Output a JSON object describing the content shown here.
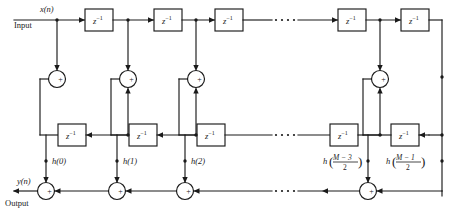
{
  "diagram": {
    "signals": {
      "input_signal": "x(n)",
      "input_label": "Input",
      "output_signal": "y(n)",
      "output_label": "Output"
    },
    "delay_label": "z",
    "delay_exponent": "−1",
    "adder_symbol": "+",
    "ellipsis": "⋯",
    "top_delays": [
      {
        "id": "top-delay-1",
        "label": "z",
        "exp": "−1"
      },
      {
        "id": "top-delay-2",
        "label": "z",
        "exp": "−1"
      },
      {
        "id": "top-delay-3",
        "label": "z",
        "exp": "−1"
      },
      {
        "id": "top-delay-4",
        "label": "z",
        "exp": "−1"
      },
      {
        "id": "top-delay-5",
        "label": "z",
        "exp": "−1"
      }
    ],
    "middle_delays": [
      {
        "id": "mid-delay-1",
        "label": "z",
        "exp": "−1"
      },
      {
        "id": "mid-delay-2",
        "label": "z",
        "exp": "−1"
      },
      {
        "id": "mid-delay-3",
        "label": "z",
        "exp": "−1"
      },
      {
        "id": "mid-delay-4",
        "label": "z",
        "exp": "−1"
      },
      {
        "id": "mid-delay-5",
        "label": "z",
        "exp": "−1"
      }
    ],
    "coefficients": [
      {
        "id": "coef-h0",
        "text": "h(0)",
        "kind": "plain"
      },
      {
        "id": "coef-h1",
        "text": "h(1)",
        "kind": "plain"
      },
      {
        "id": "coef-h2",
        "text": "h(2)",
        "kind": "plain"
      },
      {
        "id": "coef-hm3",
        "text": "h",
        "kind": "fraction",
        "numerator": "M − 3",
        "denominator": "2"
      },
      {
        "id": "coef-hm1",
        "text": "h",
        "kind": "fraction",
        "numerator": "M − 1",
        "denominator": "2"
      }
    ],
    "adders_upper": [
      {
        "id": "adder-upper-1",
        "symbol": "+"
      },
      {
        "id": "adder-upper-2",
        "symbol": "+"
      },
      {
        "id": "adder-upper-3",
        "symbol": "+"
      },
      {
        "id": "adder-upper-4",
        "symbol": "+"
      }
    ],
    "adders_output": [
      {
        "id": "adder-out-1",
        "symbol": "+"
      },
      {
        "id": "adder-out-2",
        "symbol": "+"
      },
      {
        "id": "adder-out-3",
        "symbol": "+"
      },
      {
        "id": "adder-out-4",
        "symbol": "+"
      }
    ],
    "colors": {
      "line": "#1a1a1a",
      "background": "#ffffff",
      "text": "#1a1a1a"
    }
  }
}
